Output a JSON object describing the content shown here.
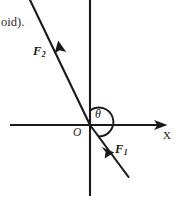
{
  "figure": {
    "title_fragment": "oid).",
    "background_color": "#ffffff",
    "stroke_color": "#1a1a1a",
    "axes": {
      "x_axis_label": "X",
      "x_axis": {
        "x1": 10,
        "y1": 125,
        "x2": 167,
        "y2": 125,
        "arrow": "right"
      },
      "y_axis": {
        "x1": 90,
        "y1": 0,
        "x2": 90,
        "y2": 196,
        "arrow": "none"
      },
      "origin_label": "O",
      "origin": {
        "x": 90,
        "y": 125
      }
    },
    "vectors": [
      {
        "label": "F",
        "subscript": "1",
        "name": "force-1",
        "direction": "down-right",
        "from": {
          "x": 90,
          "y": 125
        },
        "to": {
          "x": 128,
          "y": 177
        },
        "arrow_tip": {
          "x": 113,
          "y": 151
        }
      },
      {
        "label": "F",
        "subscript": "2",
        "name": "force-2",
        "direction": "up-left",
        "from": {
          "x": 90,
          "y": 125
        },
        "to": {
          "x": 30,
          "y": 0
        },
        "arrow_tip": {
          "x": 59,
          "y": 42
        }
      }
    ],
    "angle": {
      "symbol": "θ",
      "name": "theta",
      "between": [
        "y-axis-positive",
        "force-1"
      ],
      "arc_center": {
        "x": 90,
        "y": 125
      },
      "arc_radius": 14
    }
  }
}
